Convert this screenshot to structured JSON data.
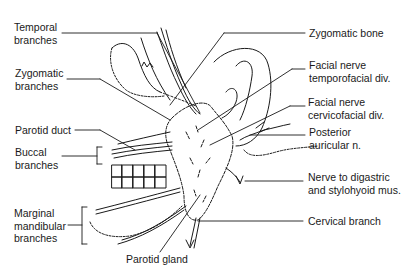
{
  "diagram": {
    "labels_left": [
      {
        "id": "temporal",
        "line1": "Temporal",
        "line2": "branches"
      },
      {
        "id": "zygomatic",
        "line1": "Zygomatic",
        "line2": "branches"
      },
      {
        "id": "parotid_duct",
        "line1": "Parotid duct",
        "line2": ""
      },
      {
        "id": "buccal",
        "line1": "Buccal",
        "line2": "branches"
      },
      {
        "id": "marginal",
        "line1": "Marginal",
        "line2": "mandibular",
        "line3": "branches"
      }
    ],
    "labels_right": [
      {
        "id": "zygomatic_bone",
        "line1": "Zygomatic bone",
        "line2": ""
      },
      {
        "id": "temporofacial",
        "line1": "Facial nerve",
        "line2": "temporofacial div."
      },
      {
        "id": "cervicofacial",
        "line1": "Facial nerve",
        "line2": "cervicofacial div."
      },
      {
        "id": "posterior_auricular",
        "line1": "Posterior",
        "line2": "auricular n."
      },
      {
        "id": "digastric",
        "line1": "Nerve to digastric",
        "line2": "and stylohyoid mus."
      },
      {
        "id": "cervical",
        "line1": "Cervical branch",
        "line2": ""
      }
    ],
    "labels_bottom": [
      {
        "id": "parotid_gland",
        "line1": "Parotid gland"
      }
    ],
    "colors": {
      "ink": "#1a1a1a",
      "background": "#ffffff"
    }
  }
}
